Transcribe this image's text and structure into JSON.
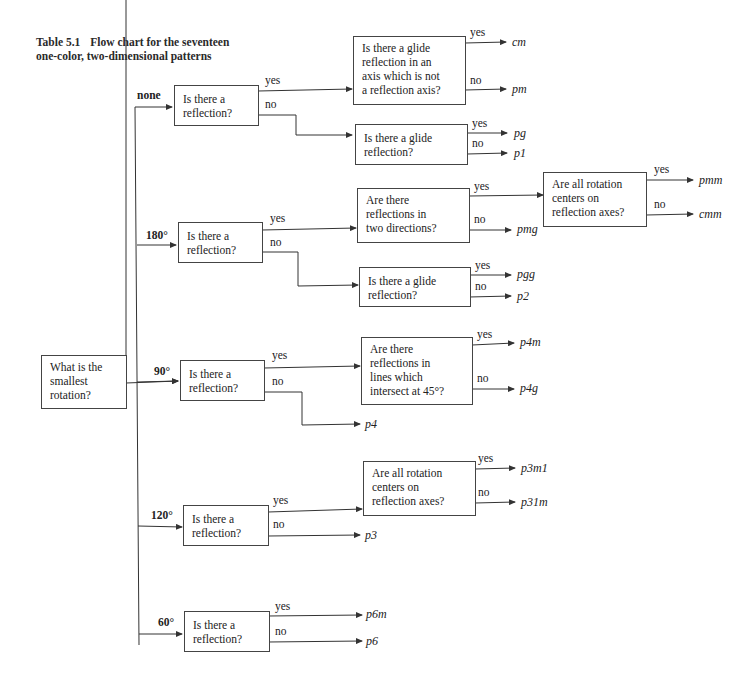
{
  "title": {
    "number": "Table 5.1",
    "line1": "Flow chart for the seventeen",
    "line2": "one-color, two-dimensional patterns"
  },
  "root": {
    "question": "What is the smallest rotation?",
    "lines": [
      "What is the",
      "smallest",
      "rotation?"
    ]
  },
  "rotations": [
    {
      "label": "none",
      "question_lines": [
        "Is there a",
        "reflection?"
      ],
      "yes": "yes",
      "no": "no",
      "yes_box": {
        "lines": [
          "Is there a glide",
          "reflection in an",
          "axis which is not",
          "a reflection axis?"
        ],
        "yes": "yes",
        "no": "no",
        "yes_result": "cm",
        "no_result": "pm"
      },
      "no_box": {
        "lines": [
          "Is there a glide",
          "reflection?"
        ],
        "yes": "yes",
        "no": "no",
        "yes_result": "pg",
        "no_result": "p1"
      }
    },
    {
      "label": "180°",
      "question_lines": [
        "Is there a",
        "reflection?"
      ],
      "yes": "yes",
      "no": "no",
      "yes_box": {
        "lines": [
          "Are there",
          "reflections in",
          "two directions?"
        ],
        "yes": "yes",
        "no": "no",
        "no_result": "pmg",
        "yes_box": {
          "lines": [
            "Are all rotation",
            "centers on",
            "reflection axes?"
          ],
          "yes": "yes",
          "no": "no",
          "yes_result": "pmm",
          "no_result": "cmm"
        }
      },
      "no_box": {
        "lines": [
          "Is there a glide",
          "reflection?"
        ],
        "yes": "yes",
        "no": "no",
        "yes_result": "pgg",
        "no_result": "p2"
      }
    },
    {
      "label": "90°",
      "question_lines": [
        "Is there a",
        "reflection?"
      ],
      "yes": "yes",
      "no": "no",
      "yes_box": {
        "lines": [
          "Are there",
          "reflections in",
          "lines which",
          "intersect at 45°?"
        ],
        "yes": "yes",
        "no": "no",
        "yes_result": "p4m",
        "no_result": "p4g"
      },
      "no_result": "p4"
    },
    {
      "label": "120°",
      "question_lines": [
        "Is there a",
        "reflection?"
      ],
      "yes": "yes",
      "no": "no",
      "yes_box": {
        "lines": [
          "Are all rotation",
          "centers on",
          "reflection axes?"
        ],
        "yes": "yes",
        "no": "no",
        "yes_result": "p3m1",
        "no_result": "p31m"
      },
      "no_result": "p3"
    },
    {
      "label": "60°",
      "question_lines": [
        "Is there a",
        "reflection?"
      ],
      "yes": "yes",
      "no": "no",
      "yes_result": "p6m",
      "no_result": "p6"
    }
  ]
}
